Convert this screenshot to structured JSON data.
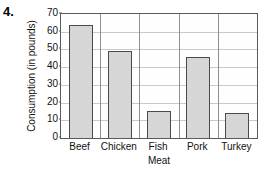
{
  "problem": {
    "number": "4."
  },
  "chart_data": {
    "type": "bar",
    "title": "",
    "xlabel": "Meat",
    "ylabel": "Consumption (in pounds)",
    "categories": [
      "Beef",
      "Chicken",
      "Fish",
      "Pork",
      "Turkey"
    ],
    "values": [
      64,
      49,
      15,
      46,
      14
    ],
    "ylim": [
      0,
      70
    ],
    "ytick_labels": [
      "0",
      "10",
      "20",
      "30",
      "40",
      "50",
      "60",
      "70"
    ],
    "ytick_values": [
      0,
      10,
      20,
      30,
      40,
      50,
      60,
      70
    ],
    "grid": "horizontal-and-category-dividers",
    "legend": "none",
    "colors": {
      "bar_fill": "#d6d6d6",
      "bar_border": "#4a4a4a",
      "grid_line": "#c9c9c9",
      "divider_line": "#8e8e8e",
      "frame": "#5a5a5a",
      "text": "#111111",
      "background": "#ffffff"
    }
  }
}
